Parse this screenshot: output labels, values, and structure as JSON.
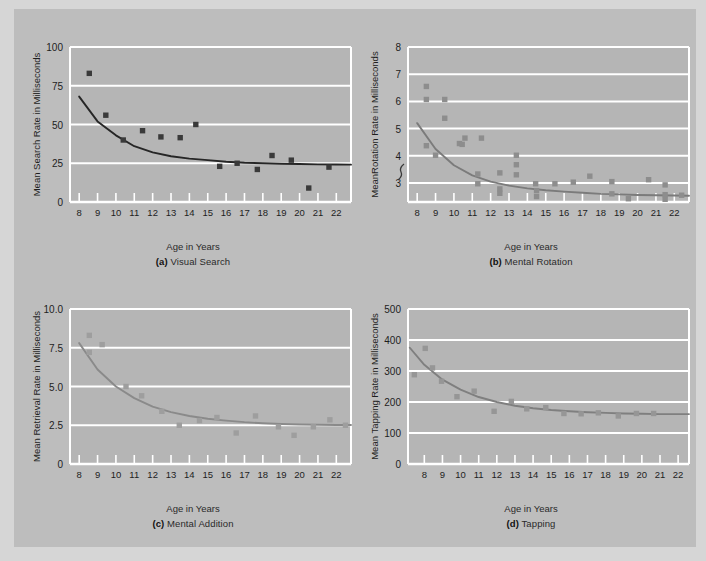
{
  "figure": {
    "background": "#bdbdbd",
    "plot_fill": "#b5b5b5",
    "grid_color": "#ffffff"
  },
  "panels": [
    {
      "id": "a",
      "label_prefix": "(a)",
      "title": "Visual Search",
      "ylabel": "Mean Search Rate in Milliseconds",
      "xlabel": "Age in Years",
      "marker_color": "#3a3a3a",
      "curve_color": "#262626",
      "axis_break": false,
      "chart_data": {
        "type": "scatter",
        "title": "Visual Search",
        "xlabel": "Age in Years",
        "ylabel": "Mean Search Rate in Milliseconds",
        "xlim": [
          7.5,
          22.8
        ],
        "ylim": [
          0,
          100
        ],
        "xticks": [
          8,
          9,
          10,
          11,
          12,
          13,
          14,
          15,
          16,
          17,
          18,
          19,
          20,
          21,
          22
        ],
        "yticks": [
          0,
          25,
          50,
          75,
          100
        ],
        "grid": true,
        "legend": "none",
        "points": [
          {
            "x": 8.55,
            "y": 83
          },
          {
            "x": 9.45,
            "y": 56
          },
          {
            "x": 10.4,
            "y": 40
          },
          {
            "x": 11.45,
            "y": 46
          },
          {
            "x": 12.45,
            "y": 42
          },
          {
            "x": 13.5,
            "y": 41.5
          },
          {
            "x": 14.35,
            "y": 50
          },
          {
            "x": 15.65,
            "y": 23
          },
          {
            "x": 16.6,
            "y": 25
          },
          {
            "x": 17.7,
            "y": 21
          },
          {
            "x": 18.5,
            "y": 30
          },
          {
            "x": 19.55,
            "y": 27
          },
          {
            "x": 20.5,
            "y": 9
          },
          {
            "x": 21.6,
            "y": 22.5
          }
        ],
        "fit_curve": {
          "kind": "power-decay",
          "y_at_x": [
            [
              8.0,
              68
            ],
            [
              9,
              52
            ],
            [
              10,
              43
            ],
            [
              11,
              36
            ],
            [
              12,
              32
            ],
            [
              13,
              29.5
            ],
            [
              14,
              28
            ],
            [
              15,
              27
            ],
            [
              16,
              26
            ],
            [
              17,
              25.3
            ],
            [
              18,
              25
            ],
            [
              19,
              24.7
            ],
            [
              20,
              24.5
            ],
            [
              21,
              24.3
            ],
            [
              22,
              24.2
            ],
            [
              22.8,
              24.1
            ]
          ]
        }
      }
    },
    {
      "id": "b",
      "label_prefix": "(b)",
      "title": "Mental Rotation",
      "ylabel": "MeanRotation Rate in Milliseconds",
      "xlabel": "Age in Years",
      "marker_color": "#8d8d8d",
      "curve_color": "#7b7b7b",
      "axis_break": true,
      "chart_data": {
        "type": "scatter",
        "title": "Mental Rotation",
        "xlabel": "Age in Years",
        "ylabel": "MeanRotation Rate in Milliseconds",
        "xlim": [
          7.5,
          22.8
        ],
        "ylim": [
          2.3,
          8
        ],
        "xticks": [
          8,
          9,
          10,
          11,
          12,
          13,
          14,
          15,
          16,
          17,
          18,
          19,
          20,
          21,
          22
        ],
        "yticks": [
          3,
          4,
          5,
          6,
          7,
          8
        ],
        "grid": true,
        "legend": "none",
        "points": [
          {
            "x": 8.5,
            "y": 6.55
          },
          {
            "x": 8.5,
            "y": 6.07
          },
          {
            "x": 8.5,
            "y": 4.37
          },
          {
            "x": 9.0,
            "y": 4.02
          },
          {
            "x": 9.5,
            "y": 6.07
          },
          {
            "x": 9.5,
            "y": 5.38
          },
          {
            "x": 10.3,
            "y": 4.45
          },
          {
            "x": 10.45,
            "y": 4.42
          },
          {
            "x": 10.6,
            "y": 4.65
          },
          {
            "x": 11.3,
            "y": 3.33
          },
          {
            "x": 11.3,
            "y": 2.97
          },
          {
            "x": 11.5,
            "y": 4.65
          },
          {
            "x": 12.5,
            "y": 3.37
          },
          {
            "x": 12.5,
            "y": 2.78
          },
          {
            "x": 12.5,
            "y": 2.62
          },
          {
            "x": 13.4,
            "y": 4.02
          },
          {
            "x": 13.4,
            "y": 3.67
          },
          {
            "x": 13.4,
            "y": 3.3
          },
          {
            "x": 14.45,
            "y": 2.97
          },
          {
            "x": 14.5,
            "y": 2.72
          },
          {
            "x": 14.5,
            "y": 2.5
          },
          {
            "x": 15.5,
            "y": 2.97
          },
          {
            "x": 16.5,
            "y": 3.03
          },
          {
            "x": 17.4,
            "y": 3.25
          },
          {
            "x": 18.6,
            "y": 3.05
          },
          {
            "x": 18.6,
            "y": 2.6
          },
          {
            "x": 19.5,
            "y": 2.42
          },
          {
            "x": 20.6,
            "y": 3.12
          },
          {
            "x": 21.5,
            "y": 2.93
          },
          {
            "x": 21.5,
            "y": 2.57
          },
          {
            "x": 21.5,
            "y": 2.4
          },
          {
            "x": 22.4,
            "y": 2.55
          }
        ],
        "fit_curve": {
          "kind": "power-decay",
          "y_at_x": [
            [
              8.0,
              5.2
            ],
            [
              9,
              4.25
            ],
            [
              10,
              3.65
            ],
            [
              11,
              3.28
            ],
            [
              12,
              3.05
            ],
            [
              13,
              2.9
            ],
            [
              14,
              2.8
            ],
            [
              15,
              2.73
            ],
            [
              16,
              2.68
            ],
            [
              17,
              2.64
            ],
            [
              18,
              2.6
            ],
            [
              19,
              2.58
            ],
            [
              20,
              2.56
            ],
            [
              21,
              2.55
            ],
            [
              22,
              2.54
            ],
            [
              22.8,
              2.53
            ]
          ]
        }
      }
    },
    {
      "id": "c",
      "label_prefix": "(c)",
      "title": "Mental Addition",
      "ylabel": "Mean Retrieval Rate in Milliseconds",
      "xlabel": "Age in Years",
      "marker_color": "#9e9e9e",
      "curve_color": "#8a8a8a",
      "axis_break": false,
      "chart_data": {
        "type": "scatter",
        "title": "Mental Addition",
        "xlabel": "Age in Years",
        "ylabel": "Mean Retrieval Rate in Milliseconds",
        "xlim": [
          7.5,
          22.8
        ],
        "ylim": [
          0,
          10
        ],
        "xticks": [
          8,
          9,
          10,
          11,
          12,
          13,
          14,
          15,
          16,
          17,
          18,
          19,
          20,
          21,
          22
        ],
        "yticks": [
          0,
          2.5,
          5.0,
          7.5,
          10.0
        ],
        "ytick_labels": [
          "0",
          "2.5",
          "5.0",
          "7.5",
          "10.0"
        ],
        "grid": true,
        "legend": "none",
        "points": [
          {
            "x": 8.55,
            "y": 8.3
          },
          {
            "x": 8.55,
            "y": 7.2
          },
          {
            "x": 9.25,
            "y": 7.7
          },
          {
            "x": 10.55,
            "y": 5.0
          },
          {
            "x": 11.4,
            "y": 4.4
          },
          {
            "x": 12.5,
            "y": 3.4
          },
          {
            "x": 13.45,
            "y": 2.5
          },
          {
            "x": 14.55,
            "y": 2.8
          },
          {
            "x": 15.5,
            "y": 3.0
          },
          {
            "x": 16.55,
            "y": 2.0
          },
          {
            "x": 17.6,
            "y": 3.1
          },
          {
            "x": 18.85,
            "y": 2.4
          },
          {
            "x": 19.7,
            "y": 1.85
          },
          {
            "x": 20.75,
            "y": 2.4
          },
          {
            "x": 21.65,
            "y": 2.85
          },
          {
            "x": 22.5,
            "y": 2.5
          }
        ],
        "fit_curve": {
          "kind": "power-decay",
          "y_at_x": [
            [
              8.0,
              7.8
            ],
            [
              9,
              6.1
            ],
            [
              10,
              5.0
            ],
            [
              11,
              4.25
            ],
            [
              12,
              3.7
            ],
            [
              13,
              3.35
            ],
            [
              14,
              3.1
            ],
            [
              15,
              2.92
            ],
            [
              16,
              2.8
            ],
            [
              17,
              2.7
            ],
            [
              18,
              2.63
            ],
            [
              19,
              2.58
            ],
            [
              20,
              2.55
            ],
            [
              21,
              2.53
            ],
            [
              22,
              2.52
            ],
            [
              22.8,
              2.52
            ]
          ]
        }
      }
    },
    {
      "id": "d",
      "label_prefix": "(d)",
      "title": "Tapping",
      "ylabel": "Mean Tapping Rate in Milliseconds",
      "xlabel": "Age in Years",
      "marker_color": "#969696",
      "curve_color": "#7f7f7f",
      "axis_break": false,
      "chart_data": {
        "type": "scatter",
        "title": "Tapping",
        "xlabel": "Age in Years",
        "ylabel": "Mean Tapping Rate in Milliseconds",
        "xlim": [
          7.1,
          22.6
        ],
        "ylim": [
          0,
          500
        ],
        "xticks": [
          8,
          9,
          10,
          11,
          12,
          13,
          14,
          15,
          16,
          17,
          18,
          19,
          20,
          21,
          22
        ],
        "yticks": [
          0,
          100,
          200,
          300,
          400,
          500
        ],
        "grid": true,
        "legend": "none",
        "points": [
          {
            "x": 7.45,
            "y": 288
          },
          {
            "x": 8.05,
            "y": 373
          },
          {
            "x": 8.45,
            "y": 310
          },
          {
            "x": 8.95,
            "y": 267
          },
          {
            "x": 9.8,
            "y": 217
          },
          {
            "x": 10.75,
            "y": 235
          },
          {
            "x": 11.85,
            "y": 170
          },
          {
            "x": 12.8,
            "y": 202
          },
          {
            "x": 13.65,
            "y": 178
          },
          {
            "x": 14.7,
            "y": 182
          },
          {
            "x": 15.7,
            "y": 163
          },
          {
            "x": 16.65,
            "y": 162
          },
          {
            "x": 17.6,
            "y": 165
          },
          {
            "x": 18.7,
            "y": 155
          },
          {
            "x": 19.7,
            "y": 163
          },
          {
            "x": 20.65,
            "y": 163
          }
        ],
        "fit_curve": {
          "kind": "power-decay",
          "y_at_x": [
            [
              7.2,
              375
            ],
            [
              8,
              320
            ],
            [
              9,
              272
            ],
            [
              10,
              240
            ],
            [
              11,
              216
            ],
            [
              12,
              200
            ],
            [
              13,
              188
            ],
            [
              14,
              180
            ],
            [
              15,
              174
            ],
            [
              16,
              170
            ],
            [
              17,
              167
            ],
            [
              18,
              165
            ],
            [
              19,
              163
            ],
            [
              20,
              162
            ],
            [
              21,
              161
            ],
            [
              22,
              161
            ],
            [
              22.6,
              161
            ]
          ]
        }
      }
    }
  ]
}
